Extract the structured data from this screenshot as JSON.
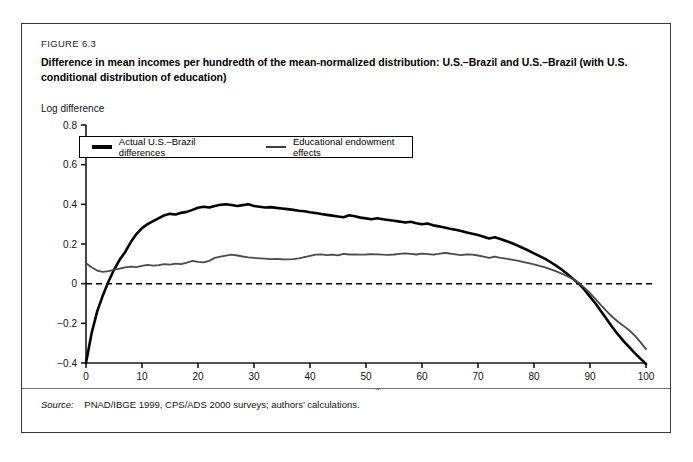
{
  "figure": {
    "number": "FIGURE 6.3",
    "title": "Difference in mean incomes per hundredth of the mean-normalized distribution: U.S.–Brazil and U.S.–Brazil (with U.S. conditional distribution of education)",
    "source_label": "Source:",
    "source_text": "PNAD/IBGE 1999, CPS/ADS 2000 surveys; authors’ calculations."
  },
  "colors": {
    "series_actual": "#000000",
    "series_education": "#4a4a4a",
    "axis": "#1a1a1a",
    "zero_line": "#000000",
    "frame": "#3a3a3a"
  },
  "chart_data": {
    "type": "line",
    "title": "Difference in mean incomes per hundredth of the mean-normalized distribution: U.S.–Brazil and U.S.–Brazil (with U.S. conditional distribution of education)",
    "xlabel": "Percentiles",
    "ylabel": "Log difference",
    "xlim": [
      0,
      100
    ],
    "ylim": [
      -0.4,
      0.8
    ],
    "xticks": [
      0,
      10,
      20,
      30,
      40,
      50,
      60,
      70,
      80,
      90,
      100
    ],
    "xtick_labels": [
      "0",
      "10",
      "20",
      "30",
      "40",
      "50",
      "60",
      "70",
      "80",
      "90",
      "100"
    ],
    "yticks": [
      -0.4,
      -0.2,
      0,
      0.2,
      0.4,
      0.6,
      0.8
    ],
    "ytick_labels": [
      "−0.4",
      "−0.2",
      "0",
      "0.2",
      "0.4",
      "0.6",
      "0.8"
    ],
    "grid": false,
    "legend_position": "upper-left",
    "zero_reference_line": 0,
    "x": [
      0,
      1,
      2,
      3,
      4,
      5,
      6,
      7,
      8,
      9,
      10,
      11,
      12,
      13,
      14,
      15,
      16,
      17,
      18,
      19,
      20,
      21,
      22,
      23,
      24,
      25,
      26,
      27,
      28,
      29,
      30,
      31,
      32,
      33,
      34,
      35,
      36,
      37,
      38,
      39,
      40,
      41,
      42,
      43,
      44,
      45,
      46,
      47,
      48,
      49,
      50,
      51,
      52,
      53,
      54,
      55,
      56,
      57,
      58,
      59,
      60,
      61,
      62,
      63,
      64,
      65,
      66,
      67,
      68,
      69,
      70,
      71,
      72,
      73,
      74,
      75,
      76,
      77,
      78,
      79,
      80,
      81,
      82,
      83,
      84,
      85,
      86,
      87,
      88,
      89,
      90,
      91,
      92,
      93,
      94,
      95,
      96,
      97,
      98,
      99,
      100
    ],
    "series": [
      {
        "name": "Actual U.S.–Brazil differences",
        "color": "#000000",
        "line_width": 2.6,
        "values": [
          -0.4,
          -0.25,
          -0.14,
          -0.06,
          0.01,
          0.07,
          0.12,
          0.16,
          0.21,
          0.25,
          0.28,
          0.3,
          0.315,
          0.33,
          0.345,
          0.352,
          0.349,
          0.357,
          0.362,
          0.372,
          0.383,
          0.388,
          0.384,
          0.392,
          0.398,
          0.4,
          0.397,
          0.392,
          0.396,
          0.4,
          0.392,
          0.388,
          0.384,
          0.386,
          0.382,
          0.379,
          0.376,
          0.372,
          0.368,
          0.365,
          0.36,
          0.356,
          0.351,
          0.347,
          0.343,
          0.339,
          0.335,
          0.345,
          0.34,
          0.333,
          0.329,
          0.325,
          0.33,
          0.325,
          0.321,
          0.317,
          0.313,
          0.308,
          0.312,
          0.305,
          0.3,
          0.303,
          0.294,
          0.289,
          0.283,
          0.277,
          0.272,
          0.266,
          0.258,
          0.252,
          0.245,
          0.237,
          0.228,
          0.234,
          0.225,
          0.215,
          0.205,
          0.193,
          0.18,
          0.167,
          0.153,
          0.139,
          0.125,
          0.108,
          0.09,
          0.07,
          0.047,
          0.024,
          0.0,
          -0.03,
          -0.065,
          -0.1,
          -0.14,
          -0.18,
          -0.22,
          -0.256,
          -0.29,
          -0.32,
          -0.35,
          -0.378,
          -0.405
        ]
      },
      {
        "name": "Educational endowment effects",
        "color": "#4a4a4a",
        "line_width": 1.8,
        "values": [
          0.103,
          0.083,
          0.066,
          0.06,
          0.063,
          0.07,
          0.076,
          0.082,
          0.086,
          0.083,
          0.09,
          0.095,
          0.091,
          0.093,
          0.099,
          0.096,
          0.101,
          0.099,
          0.106,
          0.115,
          0.11,
          0.107,
          0.115,
          0.13,
          0.136,
          0.141,
          0.146,
          0.142,
          0.137,
          0.133,
          0.13,
          0.128,
          0.126,
          0.124,
          0.125,
          0.123,
          0.122,
          0.124,
          0.128,
          0.134,
          0.14,
          0.146,
          0.148,
          0.144,
          0.146,
          0.143,
          0.15,
          0.147,
          0.148,
          0.146,
          0.147,
          0.149,
          0.148,
          0.146,
          0.145,
          0.147,
          0.15,
          0.153,
          0.15,
          0.147,
          0.152,
          0.149,
          0.146,
          0.15,
          0.155,
          0.152,
          0.148,
          0.144,
          0.148,
          0.146,
          0.142,
          0.136,
          0.13,
          0.136,
          0.13,
          0.126,
          0.121,
          0.116,
          0.11,
          0.104,
          0.097,
          0.09,
          0.082,
          0.072,
          0.062,
          0.05,
          0.036,
          0.022,
          0.004,
          -0.02,
          -0.048,
          -0.078,
          -0.11,
          -0.14,
          -0.168,
          -0.192,
          -0.213,
          -0.235,
          -0.262,
          -0.295,
          -0.33
        ]
      }
    ]
  },
  "legend": {
    "items": [
      {
        "label": "Actual U.S.–Brazil differences"
      },
      {
        "label": "Educational endowment effects"
      }
    ]
  }
}
